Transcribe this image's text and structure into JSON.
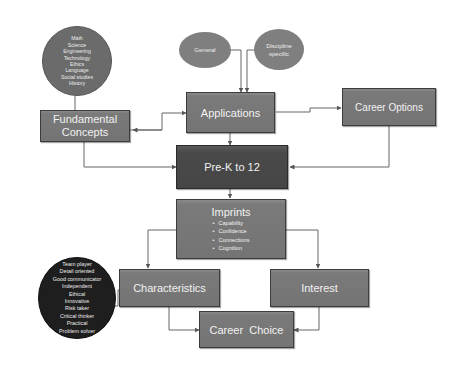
{
  "diagram": {
    "nodes": {
      "subjects_circle": {
        "items": [
          "Math",
          "Science",
          "Engineering",
          "Technology",
          "Ethics",
          "Language",
          "Social studies",
          "History"
        ]
      },
      "general_oval": {
        "label": "General"
      },
      "discipline_oval": {
        "label_line1": "Discipline",
        "label_line2": "specific"
      },
      "fundamental_concepts": {
        "label_line1": "Fundamental",
        "label_line2": "Concepts"
      },
      "applications": {
        "label": "Applications"
      },
      "career_options": {
        "label": "Career Options"
      },
      "prek12": {
        "label": "Pre-K to 12"
      },
      "imprints": {
        "title": "Imprints",
        "bullets": [
          "Capability",
          "Confidence",
          "Connections",
          "Cognition"
        ]
      },
      "traits_circle": {
        "items": [
          "Team player",
          "Detail oriented",
          "Good communicator",
          "Independent",
          "Ethical",
          "Innovative",
          "Risk taker",
          "Critical thinker",
          "Practical",
          "Problem solver"
        ]
      },
      "characteristics": {
        "label": "Characteristics"
      },
      "interest": {
        "label": "Interest"
      },
      "career_choice": {
        "label": "Career  Choice"
      }
    },
    "edges": [
      {
        "from": "subjects_circle",
        "to": "fundamental_concepts"
      },
      {
        "from": "general_oval",
        "to": "applications"
      },
      {
        "from": "discipline_oval",
        "to": "applications"
      },
      {
        "from": "fundamental_concepts",
        "to": "applications",
        "bidirectional": true
      },
      {
        "from": "applications",
        "to": "career_options"
      },
      {
        "from": "applications",
        "to": "prek12"
      },
      {
        "from": "fundamental_concepts",
        "to": "prek12"
      },
      {
        "from": "career_options",
        "to": "prek12"
      },
      {
        "from": "prek12",
        "to": "imprints"
      },
      {
        "from": "imprints",
        "to": "characteristics"
      },
      {
        "from": "imprints",
        "to": "interest"
      },
      {
        "from": "traits_circle",
        "to": "characteristics"
      },
      {
        "from": "characteristics",
        "to": "career_choice"
      },
      {
        "from": "interest",
        "to": "career_choice"
      }
    ],
    "colors": {
      "box_fill": "#777777",
      "box_dark_fill": "#484848",
      "oval_fill": "#7f7f7f",
      "traits_circle_fill": "#1e1e1e",
      "line_color": "#555555",
      "text_color": "#f2f2f2"
    }
  }
}
